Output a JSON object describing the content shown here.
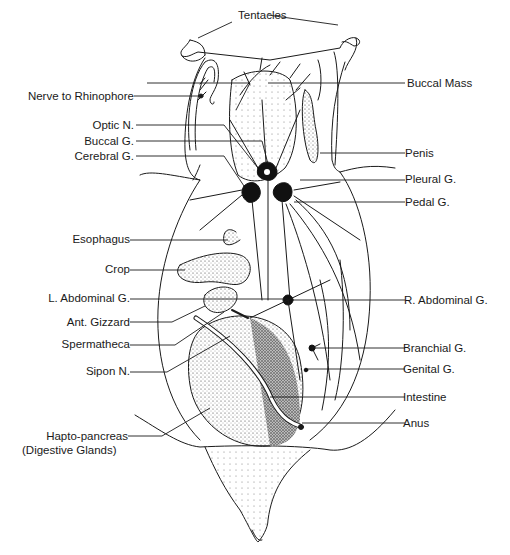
{
  "figure": {
    "ink_color": "#1a1a1a",
    "background": "#ffffff"
  },
  "labels": {
    "top": [
      {
        "id": "tentacles",
        "text": "Tentacles"
      }
    ],
    "left": [
      {
        "id": "nerve-to-rhinophore",
        "text": "Nerve to Rhinophore"
      },
      {
        "id": "optic-n",
        "text": "Optic N."
      },
      {
        "id": "buccal-g",
        "text": "Buccal G."
      },
      {
        "id": "cerebral-g",
        "text": "Cerebral G."
      },
      {
        "id": "esophagus",
        "text": "Esophagus"
      },
      {
        "id": "crop",
        "text": "Crop"
      },
      {
        "id": "l-abdominal-g",
        "text": "L. Abdominal G."
      },
      {
        "id": "ant-gizzard",
        "text": "Ant. Gizzard"
      },
      {
        "id": "spermatheca",
        "text": "Spermatheca"
      },
      {
        "id": "sipon-n",
        "text": "Sipon N."
      },
      {
        "id": "hapto-pancreas",
        "text": "Hapto-pancreas"
      },
      {
        "id": "digestive-glands",
        "text": "(Digestive Glands)"
      }
    ],
    "right": [
      {
        "id": "buccal-mass",
        "text": "Buccal Mass"
      },
      {
        "id": "penis",
        "text": "Penis"
      },
      {
        "id": "pleural-g",
        "text": "Pleural G."
      },
      {
        "id": "pedal-g",
        "text": "Pedal G."
      },
      {
        "id": "r-abdominal-g",
        "text": "R. Abdominal G."
      },
      {
        "id": "branchial-g",
        "text": "Branchial G."
      },
      {
        "id": "genital-g",
        "text": "Genital G."
      },
      {
        "id": "intestine",
        "text": "Intestine"
      },
      {
        "id": "anus",
        "text": "Anus"
      }
    ]
  }
}
